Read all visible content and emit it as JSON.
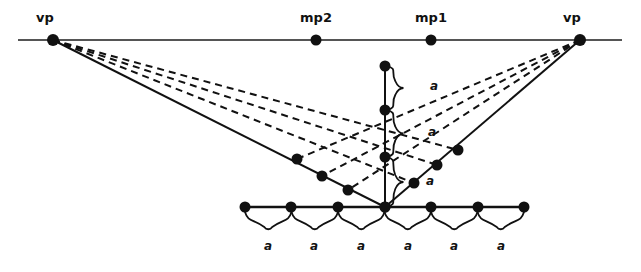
{
  "figure": {
    "type": "perspective-construction-diagram",
    "width": 641,
    "height": 272,
    "background": "#ffffff",
    "line_color": "#111111",
    "dot_color": "#111111"
  },
  "horizon": {
    "label": "horizon-line",
    "y": 40,
    "x_start": 18,
    "x_end": 622
  },
  "points": {
    "vp_left": {
      "label": "vp",
      "x": 53,
      "y": 40,
      "label_x": 45,
      "label_y": 22
    },
    "vp_right": {
      "label": "vp",
      "x": 580,
      "y": 40,
      "label_x": 572,
      "label_y": 22
    },
    "mp2": {
      "label": "mp2",
      "x": 316,
      "y": 40,
      "label_x": 316,
      "label_y": 22
    },
    "mp1": {
      "label": "mp1",
      "x": 431,
      "y": 40,
      "label_x": 431,
      "label_y": 22
    }
  },
  "center_line": {
    "label": "vertical-measuring-line",
    "x": 385,
    "y_top": 66,
    "y_bottom": 207,
    "nodes_y": [
      66,
      110,
      157,
      207
    ]
  },
  "ground_line": {
    "label": "ground-line",
    "y": 207,
    "x_start": 245,
    "x_end": 524,
    "dot_x": [
      245,
      291,
      338,
      385,
      431,
      478,
      524
    ]
  },
  "left_edge_dots": [
    {
      "x": 297,
      "y": 159
    },
    {
      "x": 322,
      "y": 176
    },
    {
      "x": 348,
      "y": 190
    }
  ],
  "right_edge_dots": [
    {
      "x": 458,
      "y": 150
    },
    {
      "x": 437,
      "y": 165
    },
    {
      "x": 414,
      "y": 183
    }
  ],
  "vertical_braces": [
    {
      "label": "a",
      "y_top": 66,
      "y_bottom": 110,
      "label_x": 434,
      "label_y": 90
    },
    {
      "label": "a",
      "y_top": 110,
      "y_bottom": 157,
      "label_x": 432,
      "label_y": 136
    },
    {
      "label": "a",
      "y_top": 157,
      "y_bottom": 207,
      "label_x": 430,
      "label_y": 185
    }
  ],
  "bottom_brace": {
    "label": "bottom-measure-brace",
    "y": 220,
    "x_start": 245,
    "x_end": 524,
    "segments": 6
  },
  "bottom_labels": [
    {
      "label": "a",
      "x": 268,
      "y": 250
    },
    {
      "label": "a",
      "x": 314,
      "y": 250
    },
    {
      "label": "a",
      "x": 361,
      "y": 250
    },
    {
      "label": "a",
      "x": 408,
      "y": 250
    },
    {
      "label": "a",
      "x": 454,
      "y": 250
    },
    {
      "label": "a",
      "x": 501,
      "y": 250
    }
  ],
  "solid_rays": [
    {
      "name": "vp-left-to-ground",
      "from": "vp_left",
      "to_x": 385,
      "to_y": 207
    },
    {
      "name": "vp-right-to-ground",
      "from": "vp_right",
      "to_x": 385,
      "to_y": 207
    }
  ],
  "dashed_rays_left": [
    {
      "name": "vpleft-ray-1",
      "to_x": 458,
      "to_y": 150
    },
    {
      "name": "vpleft-ray-2",
      "to_x": 437,
      "to_y": 165
    },
    {
      "name": "vpleft-ray-3",
      "to_x": 414,
      "to_y": 183
    }
  ],
  "dashed_rays_right": [
    {
      "name": "vpright-ray-1",
      "to_x": 297,
      "to_y": 159
    },
    {
      "name": "vpright-ray-2",
      "to_x": 322,
      "to_y": 176
    },
    {
      "name": "vpright-ray-3",
      "to_x": 348,
      "to_y": 190
    }
  ]
}
